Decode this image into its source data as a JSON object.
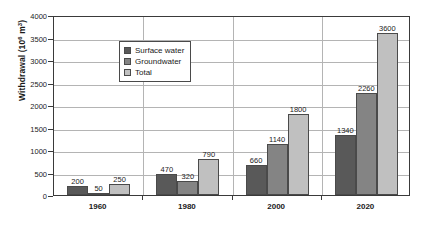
{
  "chart_data": {
    "type": "bar",
    "title": "",
    "xlabel": "",
    "ylabel": "Withdrawal (10⁶ m³)",
    "ylabel_base": "Withdrawal (10",
    "ylabel_exp": "6",
    "ylabel_tail": " m",
    "ylabel_exp2": "3",
    "ylabel_close": ")",
    "categories": [
      "1960",
      "1980",
      "2000",
      "2020"
    ],
    "series": [
      {
        "name": "Surface water",
        "color": "#595959",
        "values": [
          200,
          470,
          660,
          1340
        ]
      },
      {
        "name": "Groundwater",
        "color": "#848484",
        "values": [
          50,
          320,
          1140,
          2260
        ]
      },
      {
        "name": "Total",
        "color": "#c0c0c0",
        "values": [
          250,
          790,
          1800,
          3600
        ]
      }
    ],
    "ylim": [
      0,
      4000
    ],
    "yticks": [
      0,
      500,
      1000,
      1500,
      2000,
      2500,
      3000,
      3500,
      4000
    ],
    "ytick_labels": [
      "0",
      "500",
      "1000",
      "1500",
      "2000",
      "2500",
      "3000",
      "3500",
      "4000"
    ],
    "grid": true,
    "legend_position": "upper-left-inside",
    "data_labels": [
      [
        "200",
        "50",
        "250"
      ],
      [
        "470",
        "320",
        "790"
      ],
      [
        "660",
        "1140",
        "1800"
      ],
      [
        "1340",
        "2260",
        "3600"
      ]
    ]
  },
  "caption": ""
}
